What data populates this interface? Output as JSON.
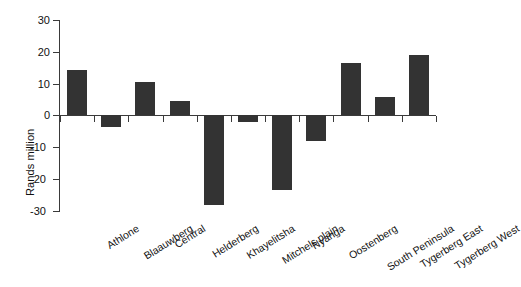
{
  "chart_data": {
    "type": "bar",
    "title": "",
    "xlabel": "",
    "ylabel": "Rands million",
    "ylim": [
      -30,
      30
    ],
    "yticks": [
      30,
      20,
      10,
      0,
      -10,
      -20,
      -30
    ],
    "grid": false,
    "legend": null,
    "categories": [
      "Athlone",
      "Blaauwberg",
      "Central",
      "Helderberg",
      "Khayelitsha",
      "Mitchels plain",
      "Nyanga",
      "Oostenberg",
      "South Peninsula",
      "Tygerberg East",
      "Tygerberg West"
    ],
    "values": [
      14.2,
      -3.8,
      10.2,
      4.3,
      -28.2,
      -2.2,
      -23.5,
      -8.0,
      16.3,
      5.7,
      18.7
    ],
    "bar_color": "#333333",
    "axis_color": "#3a3a3a",
    "background": "#ffffff"
  },
  "axis": {
    "y_title": "Rands million",
    "y_ticks": [
      "30",
      "20",
      "10",
      "0",
      "-10",
      "-20",
      "-30"
    ]
  }
}
